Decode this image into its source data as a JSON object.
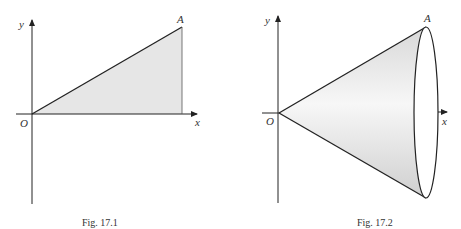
{
  "figures": [
    {
      "caption": "Fig. 17.1",
      "labels": {
        "y_axis": "y",
        "x_axis": "x",
        "origin": "O",
        "point": "A"
      },
      "shape": "right triangle under line OA",
      "fill_color": "#e6e6e6"
    },
    {
      "caption": "Fig. 17.2",
      "labels": {
        "y_axis": "y",
        "x_axis": "x",
        "origin": "O",
        "point": "A"
      },
      "shape": "cone of revolution about x-axis",
      "fill_color": "#e0e0e0"
    }
  ],
  "colors": {
    "stroke": "#222222",
    "text": "#333333"
  }
}
